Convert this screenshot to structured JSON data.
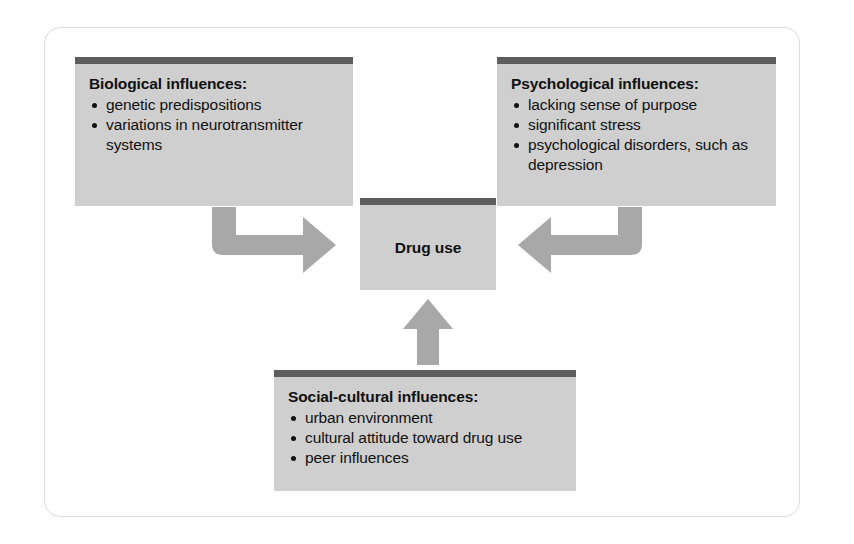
{
  "figure": {
    "caption": "",
    "colors": {
      "box_fill": "#cfcfcf",
      "box_topbar": "#5d5d5d",
      "arrow": "#a8a8a8",
      "frame_border": "#d9dcdd",
      "text": "#111111",
      "background": "#ffffff"
    }
  },
  "boxes": {
    "biological": {
      "title": "Biological influences:",
      "bullets": [
        "genetic predispositions",
        "variations in neurotransmitter systems"
      ]
    },
    "psychological": {
      "title": "Psychological influences:",
      "bullets": [
        "lacking sense of purpose",
        "significant stress",
        "psychological disorders, such as depression"
      ]
    },
    "social": {
      "title": "Social-cultural influences:",
      "bullets": [
        "urban environment",
        "cultural attitude toward drug use",
        "peer influences"
      ]
    },
    "center": {
      "title": "Drug use"
    }
  },
  "arrows": [
    {
      "name": "biological-to-drug-use",
      "direction": "down-then-right"
    },
    {
      "name": "psychological-to-drug-use",
      "direction": "down-then-left"
    },
    {
      "name": "social-to-drug-use",
      "direction": "up"
    }
  ]
}
